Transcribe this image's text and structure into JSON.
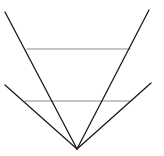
{
  "diagram": {
    "width": 164,
    "height": 156,
    "background": "#ffffff",
    "colors": {
      "ray": "#1a1a1a",
      "chord": "#8c8c8c"
    },
    "vertex": {
      "x": 77,
      "y": 149
    },
    "rays": [
      {
        "name": "steep-left-ray",
        "x1": 77,
        "y1": 149,
        "x2": 5,
        "y2": 12
      },
      {
        "name": "steep-right-ray",
        "x1": 77,
        "y1": 149,
        "x2": 149,
        "y2": 10
      },
      {
        "name": "shallow-left-ray",
        "x1": 77,
        "y1": 149,
        "x2": 5,
        "y2": 85
      },
      {
        "name": "shallow-right-ray",
        "x1": 77,
        "y1": 149,
        "x2": 151,
        "y2": 83
      }
    ],
    "chords": [
      {
        "name": "upper-horizontal-segment",
        "x1": 27,
        "y1": 49,
        "x2": 130,
        "y2": 49
      },
      {
        "name": "lower-horizontal-segment",
        "x1": 25,
        "y1": 101,
        "x2": 130,
        "y2": 101
      }
    ]
  }
}
